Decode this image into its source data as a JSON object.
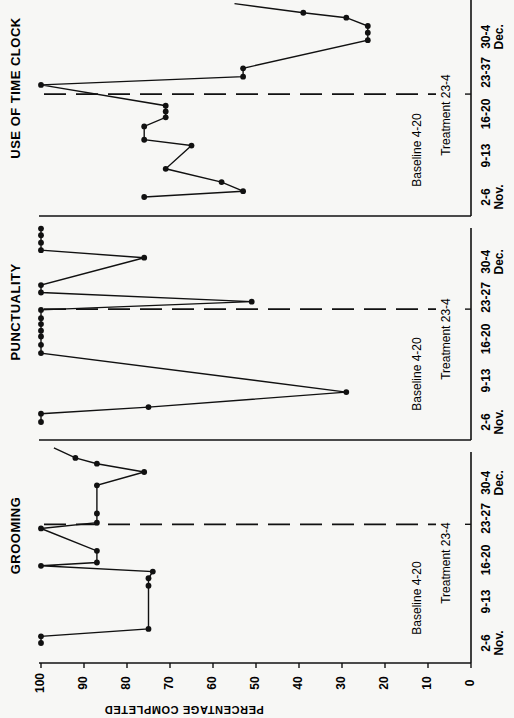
{
  "chart_data": [
    {
      "type": "line",
      "title": "USE OF TIME CLOCK",
      "xlabel": "",
      "ylabel": "PERCENTAGE COMPLETED",
      "ylim": [
        0,
        100
      ],
      "yticks": [
        "0",
        "10",
        "20",
        "30",
        "40",
        "50",
        "60",
        "70",
        "80",
        "90",
        "100"
      ],
      "week_ticks": [
        "2-6",
        "9-13",
        "16-20",
        "23-37",
        "30-4"
      ],
      "month_labels": [
        "Nov.",
        "Dec."
      ],
      "phase_labels": [
        "Baseline 4-20",
        "Treatment 23-4"
      ],
      "phase_change_after_day": 12.4,
      "days": [
        0,
        0.7,
        1.8,
        3.4,
        6.2,
        6.9,
        8.5,
        9.6,
        10.3,
        11.0,
        13.5,
        14.5,
        15.5,
        18.9,
        19.8,
        20.6,
        21.6,
        22.2
      ],
      "values": [
        76,
        53,
        58,
        71,
        65,
        76,
        76,
        71,
        71,
        71,
        100,
        53,
        53,
        24,
        24,
        24,
        29,
        39
      ],
      "continues_to": {
        "day": 23.3,
        "value": 55
      }
    },
    {
      "type": "line",
      "title": "PUNCTUALITY",
      "xlabel": "",
      "ylabel": "PERCENTAGE COMPLETED",
      "ylim": [
        0,
        100
      ],
      "yticks": [
        "0",
        "10",
        "20",
        "30",
        "40",
        "50",
        "60",
        "70",
        "80",
        "90",
        "100"
      ],
      "week_ticks": [
        "2-6",
        "9-13",
        "16-20",
        "23-27",
        "30-4"
      ],
      "month_labels": [
        "Nov.",
        "Dec."
      ],
      "phase_labels": [
        "Baseline 4-20",
        "Treatment 23-4"
      ],
      "phase_change_after_day": 13.6,
      "days": [
        0,
        1.0,
        1.8,
        3.6,
        8.3,
        9.3,
        10.3,
        11.0,
        11.8,
        12.5,
        13.5,
        14.5,
        15.6,
        16.5,
        19.8,
        20.7,
        21.6,
        22.5,
        23.3
      ],
      "values": [
        100,
        100,
        75,
        29,
        100,
        100,
        100,
        100,
        100,
        100,
        100,
        51,
        100,
        100,
        76,
        100,
        100,
        100,
        100
      ]
    },
    {
      "type": "line",
      "title": "GROOMING",
      "xlabel": "",
      "ylabel": "PERCENTAGE COMPLETED",
      "ylim": [
        0,
        100
      ],
      "yticks": [
        "0",
        "10",
        "20",
        "30",
        "40",
        "50",
        "60",
        "70",
        "80",
        "90",
        "100"
      ],
      "week_ticks": [
        "2-6",
        "9-13",
        "16-20",
        "23-27",
        "30-4"
      ],
      "month_labels": [
        "Nov.",
        "Dec."
      ],
      "phase_labels": [
        "Baseline 4-20",
        "Treatment 23-4"
      ],
      "phase_change_after_day": 14.3,
      "days": [
        0,
        0.8,
        1.7,
        6.9,
        7.8,
        8.6,
        9.3,
        9.7,
        11.1,
        13.8,
        14.5,
        15.6,
        19.0,
        20.6,
        21.6,
        22.3
      ],
      "values": [
        100,
        100,
        75,
        75,
        75,
        74,
        100,
        87,
        87,
        100,
        87,
        87,
        87,
        76,
        87,
        92
      ],
      "continues_to": {
        "day": 23.5,
        "value": 97
      }
    }
  ]
}
